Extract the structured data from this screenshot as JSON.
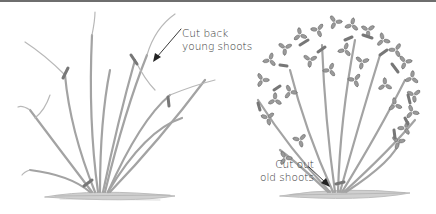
{
  "figure": {
    "panels": [
      {
        "name": "left",
        "description": "Bare-stemmed rose shrub before pruning with cut marks on young shoots",
        "annotation": {
          "line1": "Cut back",
          "line2": "young shoots"
        }
      },
      {
        "name": "right",
        "description": "Leafy rose shrub showing cut marks and old shoots at base",
        "annotation": {
          "line1": "Cut out",
          "line2": "old shoots"
        }
      }
    ],
    "colors": {
      "stem": "#9a9a9a",
      "stem_dark": "#6f6f6f",
      "cut_mark": "#7a7a7a",
      "leaf": "#8c8c8c",
      "ground": "#b5b5b5",
      "text": "#3a3a3a",
      "arrow": "#222222",
      "border": "#6e6e6e"
    }
  }
}
